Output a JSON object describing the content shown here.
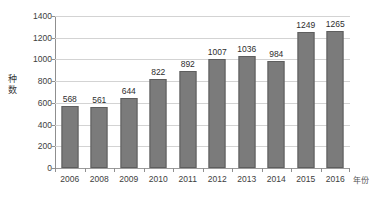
{
  "chart_data": {
    "type": "bar",
    "title": "",
    "subtitle": "",
    "xlabel": "年份",
    "ylabel": "种数",
    "categories": [
      "2006",
      "2008",
      "2009",
      "2010",
      "2011",
      "2012",
      "2013",
      "2014",
      "2015",
      "2016"
    ],
    "values": [
      568,
      561,
      644,
      822,
      892,
      1007,
      1036,
      984,
      1249,
      1265
    ],
    "series": [
      {
        "name": "种数",
        "values": [
          568,
          561,
          644,
          822,
          892,
          1007,
          1036,
          984,
          1249,
          1265
        ]
      }
    ],
    "ylim": [
      0,
      1400
    ],
    "ytick_values": [
      0,
      200,
      400,
      600,
      800,
      1000,
      1200,
      1400
    ],
    "ytick_labels": [
      "0",
      "200",
      "400",
      "600",
      "800",
      "1000",
      "1200",
      "1400"
    ],
    "y_tick_step": 200,
    "grid": true,
    "grid_axis": "y",
    "legend": false,
    "legend_position": "none",
    "data_labels": [
      "568",
      "561",
      "644",
      "822",
      "892",
      "1007",
      "1036",
      "984",
      "1249",
      "1265"
    ],
    "colors": {
      "bar_fill": "#7b7b7b",
      "bar_border": "#5e5e5e",
      "grid_line": "#d3d3d3",
      "axis_line": "#8f8f8f",
      "label_text": "#2e2e2e",
      "tick_text": "#3d3d3d",
      "background": "#ffffff"
    }
  }
}
